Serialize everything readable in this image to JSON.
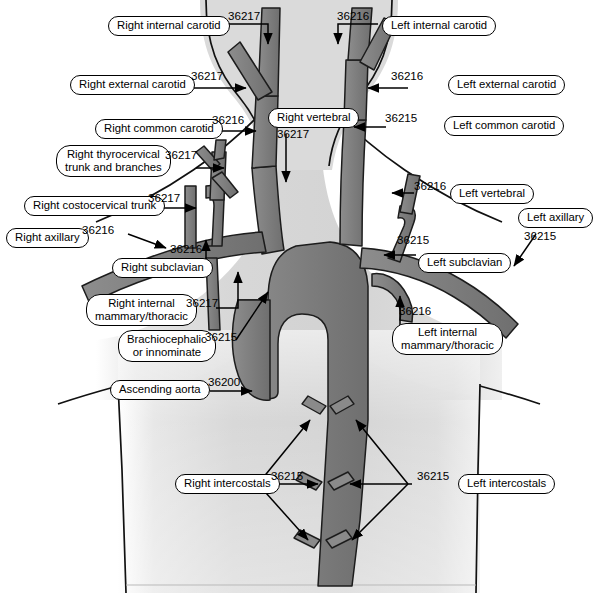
{
  "figure": {
    "colors": {
      "vessel_fill": "#808080",
      "vessel_stroke": "#1a1a1a",
      "body_shade": "#d8d8d8",
      "background": "#ffffff",
      "label_border": "#000000",
      "text": "#000000"
    }
  },
  "labels": [
    {
      "id": "right-internal-carotid",
      "text": "Right internal carotid",
      "code": "36217"
    },
    {
      "id": "left-internal-carotid",
      "text": "Left internal carotid",
      "code": "36216"
    },
    {
      "id": "right-external-carotid",
      "text": "Right external carotid",
      "code": "36217"
    },
    {
      "id": "left-external-carotid",
      "text": "Left external carotid",
      "code": "36216"
    },
    {
      "id": "right-common-carotid",
      "text": "Right common carotid",
      "code": "36216"
    },
    {
      "id": "left-common-carotid",
      "text": "Left common carotid",
      "code": "36215"
    },
    {
      "id": "right-vertebral",
      "text": "Right vertebral",
      "code": "36217"
    },
    {
      "id": "left-vertebral",
      "text": "Left vertebral",
      "code": "36216"
    },
    {
      "id": "right-thyrocervical",
      "text": "Right thyrocervical\ntrunk and branches",
      "code": "36217"
    },
    {
      "id": "right-costocervical",
      "text": "Right costocervical trunk",
      "code": "36217"
    },
    {
      "id": "right-axillary",
      "text": "Right axillary",
      "code": "36216"
    },
    {
      "id": "left-axillary",
      "text": "Left axillary",
      "code": "36215"
    },
    {
      "id": "right-subclavian",
      "text": "Right subclavian",
      "code": "36216"
    },
    {
      "id": "left-subclavian",
      "text": "Left subclavian",
      "code": "36215"
    },
    {
      "id": "right-internal-mammary",
      "text": "Right internal\nmammary/thoracic",
      "code": "36217"
    },
    {
      "id": "left-internal-mammary",
      "text": "Left internal\nmammary/thoracic",
      "code": "36216"
    },
    {
      "id": "brachiocephalic",
      "text": "Brachiocephalic\nor innominate",
      "code": "36215"
    },
    {
      "id": "ascending-aorta",
      "text": "Ascending aorta",
      "code": "36200"
    },
    {
      "id": "right-intercostals",
      "text": "Right intercostals",
      "code": "36215"
    },
    {
      "id": "left-intercostals",
      "text": "Left intercostals",
      "code": "36215"
    }
  ],
  "codes_legend": {
    "36200": "Ascending aorta",
    "36215": "First order branch",
    "36216": "Second order branch",
    "36217": "Third order branch"
  }
}
